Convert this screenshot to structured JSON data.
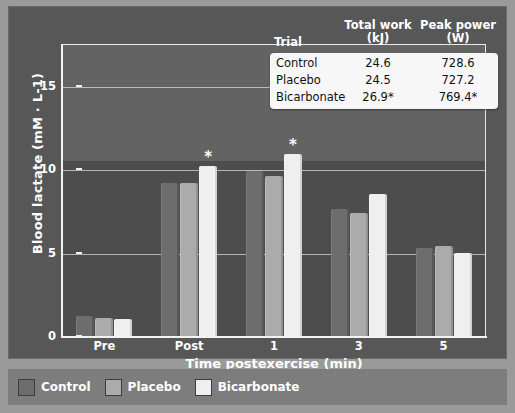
{
  "chart_data": {
    "type": "bar",
    "title": "",
    "xlabel": "Time postexercise (min)",
    "ylabel": "Blood lactate (mM · L-1)",
    "categories": [
      "Pre",
      "Post",
      "1",
      "3",
      "5"
    ],
    "ylim": [
      0,
      17.5
    ],
    "yticks": [
      0,
      5,
      10,
      15
    ],
    "ytick_labels": [
      "0",
      "5",
      "10",
      "15"
    ],
    "grid": "horizontal",
    "legend_position": "bottom",
    "series": [
      {
        "name": "Control",
        "color": "#6d6d6d",
        "values": [
          1.2,
          9.2,
          9.9,
          7.6,
          5.3
        ]
      },
      {
        "name": "Placebo",
        "color": "#ababab",
        "values": [
          1.1,
          9.2,
          9.6,
          7.4,
          5.4
        ]
      },
      {
        "name": "Bicarbonate",
        "color": "#efefef",
        "values": [
          1.0,
          10.2,
          10.9,
          8.5,
          5.0
        ]
      }
    ],
    "annotations": [
      {
        "text": "*",
        "category": "Post",
        "series": "Bicarbonate"
      },
      {
        "text": "*",
        "category": "1",
        "series": "Bicarbonate"
      }
    ]
  },
  "inset_table": {
    "headers": {
      "trial": "Trial",
      "total_work_line1": "Total work",
      "total_work_line2": "(kJ)",
      "peak_power_line1": "Peak power",
      "peak_power_line2": "(W)"
    },
    "rows": [
      {
        "trial": "Control",
        "total_work": "24.6",
        "peak_power": "728.6"
      },
      {
        "trial": "Placebo",
        "total_work": "24.5",
        "peak_power": "727.2"
      },
      {
        "trial": "Bicarbonate",
        "total_work": "26.9*",
        "peak_power": "769.4*"
      }
    ]
  },
  "legend": {
    "items": [
      {
        "label": "Control",
        "color": "#6d6d6d"
      },
      {
        "label": "Placebo",
        "color": "#ababab"
      },
      {
        "label": "Bicarbonate",
        "color": "#efefef"
      }
    ]
  }
}
